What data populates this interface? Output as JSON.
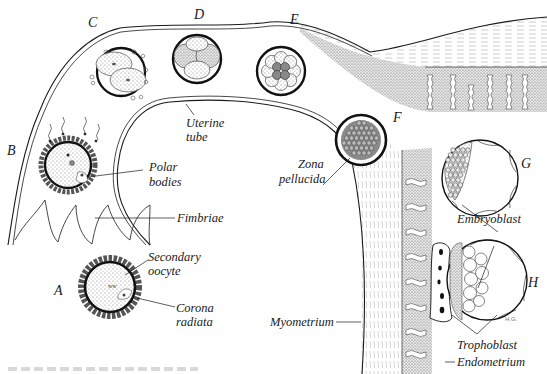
{
  "figure": {
    "stage_labels": {
      "A": "A",
      "B": "B",
      "C": "C",
      "D": "D",
      "E": "E",
      "F": "F",
      "G": "G",
      "H": "H"
    },
    "structure_labels": {
      "uterine_tube_line1": "Uterine",
      "uterine_tube_line2": "tube",
      "polar_bodies_line1": "Polar",
      "polar_bodies_line2": "bodies",
      "fimbriae": "Fimbriae",
      "secondary_oocyte_line1": "Secondary",
      "secondary_oocyte_line2": "oocyte",
      "corona_radiata_line1": "Corona",
      "corona_radiata_line2": "radiata",
      "zona_pellucida_line1": "Zona",
      "zona_pellucida_line2": "pellucida",
      "embryoblast": "Embryoblast",
      "trophoblast": "Trophoblast",
      "endometrium": "Endometrium",
      "myometrium": "Myometrium"
    },
    "artist_initials": "H.G.",
    "colors": {
      "ink": "#1a1a1a",
      "stipple": "#9a9a9a",
      "background": "#ffffff"
    }
  }
}
